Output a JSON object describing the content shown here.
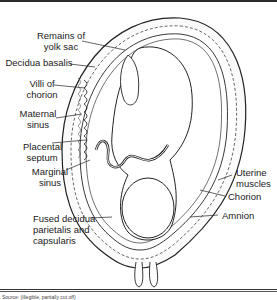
{
  "figure": {
    "type": "anatomical-diagram",
    "labels_left": [
      {
        "id": "remains-of-yolk-sac",
        "text": "Remains of yolk sac"
      },
      {
        "id": "decidua-basalis",
        "text": "Decidua basalis"
      },
      {
        "id": "villi-of-chorion",
        "text": "Villi of chorion"
      },
      {
        "id": "maternal-sinus",
        "text": "Maternal sinus"
      },
      {
        "id": "placental-septum",
        "text": "Placental septum"
      },
      {
        "id": "marginal-sinus",
        "text": "Marginal sinus"
      },
      {
        "id": "fused-decidua",
        "text": "Fused decidua parietalis and capsularis"
      }
    ],
    "labels_right": [
      {
        "id": "uterine-muscles",
        "text": "Uterine muscles"
      },
      {
        "id": "chorion",
        "text": "Chorion"
      },
      {
        "id": "amnion",
        "text": "Amnion"
      }
    ],
    "caption": "Source: (illegible, partially cut off)"
  },
  "labels": {
    "yolk1": "Remains of",
    "yolk2": "yolk sac",
    "decidua_basalis": "Decidua basalis",
    "villi1": "Villi of",
    "villi2": "chorion",
    "maternal1": "Maternal",
    "maternal2": "sinus",
    "septum1": "Placental",
    "septum2": "septum",
    "marginal1": "Marginal",
    "marginal2": "sinus",
    "fused1": "Fused decidua",
    "fused2": "parietalis and",
    "fused3": "capsularis",
    "uterine1": "Uterine",
    "uterine2": "muscles",
    "chorion": "Chorion",
    "amnion": "Amnion"
  }
}
